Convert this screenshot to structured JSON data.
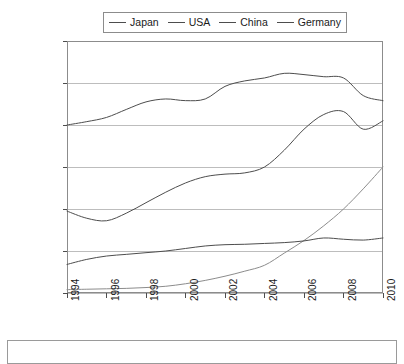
{
  "chart_data": {
    "type": "line",
    "title": "",
    "subtitle": "",
    "xlabel": "",
    "ylabel": "",
    "xlim": [
      1994,
      2010
    ],
    "ylim": [
      0,
      600000
    ],
    "grid": true,
    "legend_position": "top-center",
    "y_ticks": [
      0,
      100000,
      200000,
      300000,
      400000,
      500000,
      600000
    ],
    "y_tick_labels": [
      "0",
      "100,000",
      "200,000",
      "300,000",
      "400,000",
      "500,000",
      "600,000"
    ],
    "x_ticks": [
      1994,
      1996,
      1998,
      2000,
      2002,
      2004,
      2006,
      2008,
      2010
    ],
    "x_tick_labels": [
      "1994",
      "1996",
      "1998",
      "2000",
      "2002",
      "2004",
      "2006",
      "2008",
      "2010"
    ],
    "x": [
      1994,
      1995,
      1996,
      1997,
      1998,
      1999,
      2000,
      2001,
      2002,
      2003,
      2004,
      2005,
      2006,
      2007,
      2008,
      2009,
      2010
    ],
    "series": [
      {
        "name": "Japan",
        "color": "#4d4d4d",
        "values": [
          195000,
          178000,
          172000,
          190000,
          215000,
          240000,
          262000,
          277000,
          283000,
          286000,
          300000,
          340000,
          390000,
          425000,
          432000,
          390000,
          410000
        ]
      },
      {
        "name": "USA",
        "color": "#4d4d4d",
        "values": [
          400000,
          408000,
          418000,
          437000,
          455000,
          462000,
          458000,
          462000,
          492000,
          505000,
          512000,
          523000,
          520000,
          515000,
          512000,
          470000,
          458000
        ]
      },
      {
        "name": "China",
        "color": "#8c8c8c",
        "values": [
          8000,
          9000,
          10000,
          11000,
          13000,
          16000,
          22000,
          30000,
          40000,
          52000,
          66000,
          95000,
          125000,
          160000,
          200000,
          248000,
          300000
        ]
      },
      {
        "name": "Germany",
        "color": "#4d4d4d",
        "values": [
          68000,
          80000,
          88000,
          92000,
          96000,
          100000,
          106000,
          112000,
          115000,
          116000,
          118000,
          120000,
          124000,
          131000,
          128000,
          126000,
          131000
        ]
      }
    ]
  },
  "legend": {
    "entries": [
      {
        "label": "Japan"
      },
      {
        "label": "USA"
      },
      {
        "label": "China"
      },
      {
        "label": "Germany"
      }
    ]
  },
  "axes": {
    "plot": {
      "left": 67,
      "right": 383,
      "top": 41,
      "bottom": 293
    },
    "frame_color": "#8c8c8c",
    "grid_color": "#bdbdbd"
  }
}
